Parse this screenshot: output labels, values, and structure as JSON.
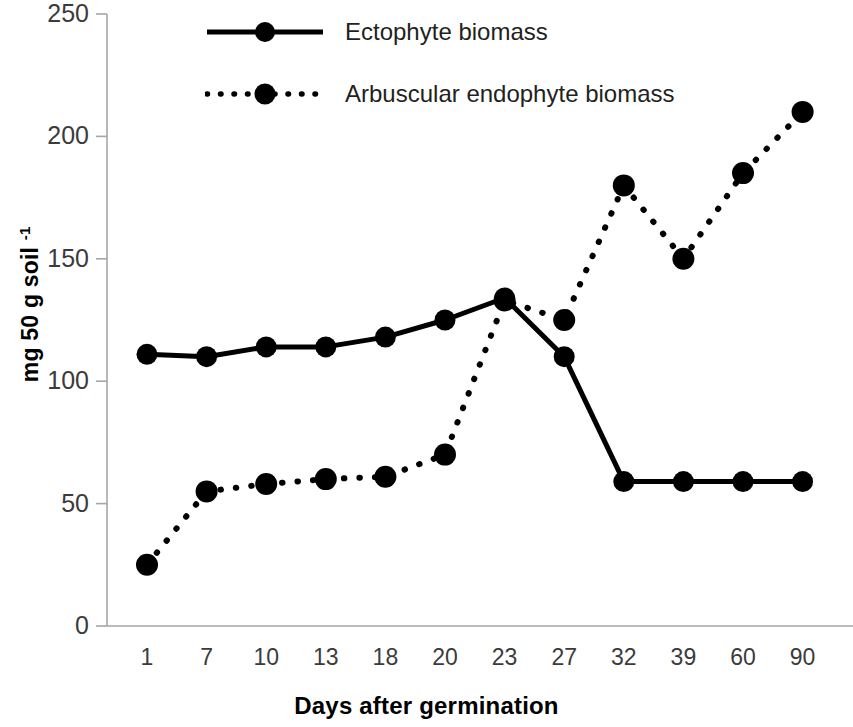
{
  "chart_data": {
    "type": "line",
    "title": "",
    "xlabel": "Days after germination",
    "ylabel": "mg 50 g soil -1",
    "ylabel_base": "mg 50 g soil ",
    "ylabel_sup": "-1",
    "categories": [
      "1",
      "7",
      "10",
      "13",
      "18",
      "20",
      "23",
      "27",
      "32",
      "39",
      "60",
      "90"
    ],
    "ylim": [
      0,
      250
    ],
    "ytick_labels": [
      "250",
      "200",
      "150",
      "100",
      "50",
      "0"
    ],
    "ytick_values": [
      250,
      200,
      150,
      100,
      50,
      0
    ],
    "grid": false,
    "legend_position": "top-center",
    "series": [
      {
        "name": "Ectophyte biomass",
        "style": "solid",
        "marker": "filled-circle",
        "color": "#000000",
        "values": [
          111,
          110,
          114,
          114,
          118,
          125,
          134,
          110,
          59,
          59,
          59,
          59
        ]
      },
      {
        "name": "Arbuscular endophyte biomass",
        "style": "dotted",
        "marker": "filled-circle",
        "color": "#000000",
        "values": [
          25,
          55,
          58,
          60,
          61,
          70,
          133,
          125,
          180,
          150,
          185,
          210
        ]
      }
    ]
  },
  "axis": {
    "color": "#a6a6a6",
    "tick_color": "#a6a6a6"
  }
}
